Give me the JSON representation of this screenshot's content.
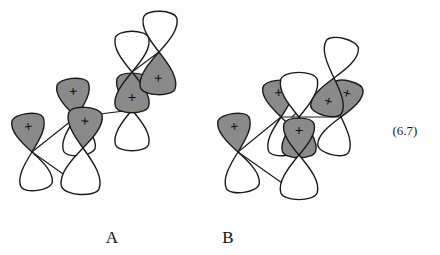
{
  "figure": {
    "kind": "orbital-interaction-diagram",
    "equation_number": "(6.7)",
    "background_color": "#fdfdfd",
    "stroke_color": "#1a1a1a",
    "shaded_lobe_color": "#8a8a8a",
    "empty_lobe_color": "#ffffff",
    "phase_symbol": "+",
    "structures": [
      {
        "label": "A",
        "label_x": 112,
        "label_y": 243,
        "description": "Five p-orbital units connected by bond lines in a zig-zag chain ascending left to right",
        "orbitals": [
          {
            "name": "orbital-a1",
            "cx": 32,
            "cy": 152,
            "rot": -8,
            "top": "shaded",
            "bottom": "empty",
            "plus": true,
            "top_len": 40,
            "bot_len": 40
          },
          {
            "name": "orbital-a2",
            "cx": 76,
            "cy": 117,
            "rot": -6,
            "top": "shaded",
            "bottom": "empty",
            "plus": true,
            "top_len": 40,
            "bot_len": 40
          },
          {
            "name": "orbital-a3",
            "cx": 83,
            "cy": 148,
            "rot": 4,
            "top": "shaded",
            "bottom": "empty",
            "plus": true,
            "top_len": 42,
            "bot_len": 48,
            "lower": true
          },
          {
            "name": "orbital-a4",
            "cx": 132,
            "cy": 110,
            "rot": 0,
            "top": "shaded",
            "bottom": "empty",
            "plus": true,
            "top_len": 38,
            "bot_len": 42
          },
          {
            "name": "orbital-a5",
            "cx": 132,
            "cy": 72,
            "rot": 0,
            "top": "empty",
            "bottom": "shaded",
            "plus": true,
            "top_len": 42,
            "bot_len": 42
          },
          {
            "name": "orbital-a6",
            "cx": 159,
            "cy": 52,
            "rot": 2,
            "top": "empty",
            "bottom": "shaded",
            "plus": true,
            "top_len": 42,
            "bot_len": 44
          }
        ],
        "bonds": [
          {
            "name": "bond-a-1",
            "x1": 32,
            "y1": 152,
            "x2": 76,
            "y2": 117
          },
          {
            "name": "bond-a-2",
            "x1": 32,
            "y1": 152,
            "x2": 83,
            "y2": 188
          },
          {
            "name": "bond-a-3",
            "x1": 76,
            "y1": 117,
            "x2": 132,
            "y2": 110
          },
          {
            "name": "bond-a-4",
            "x1": 132,
            "y1": 72,
            "x2": 159,
            "y2": 52
          }
        ]
      },
      {
        "label": "B",
        "label_x": 228,
        "label_y": 243,
        "description": "Five p-orbital units; central column stacked vertically, upper-right pair tilted",
        "orbitals": [
          {
            "name": "orbital-b1",
            "cx": 238,
            "cy": 152,
            "rot": -8,
            "top": "shaded",
            "bottom": "empty",
            "plus": true,
            "top_len": 40,
            "bot_len": 42
          },
          {
            "name": "orbital-b2",
            "cx": 281,
            "cy": 117,
            "rot": -6,
            "top": "shaded",
            "bottom": "empty",
            "plus": true,
            "top_len": 38,
            "bot_len": 40
          },
          {
            "name": "orbital-b3",
            "cx": 299,
            "cy": 117,
            "rot": 0,
            "top": "empty",
            "bottom": "shaded",
            "plus": true,
            "top_len": 46,
            "bot_len": 42
          },
          {
            "name": "orbital-b4",
            "cx": 299,
            "cy": 155,
            "rot": 0,
            "top": "shaded",
            "bottom": "empty",
            "plus": true,
            "top_len": 38,
            "bot_len": 46
          },
          {
            "name": "orbital-b5",
            "cx": 341,
            "cy": 117,
            "rot": 14,
            "top": "shaded",
            "bottom": "empty",
            "plus": true,
            "top_len": 38,
            "bot_len": 40
          },
          {
            "name": "orbital-b6",
            "cx": 334,
            "cy": 78,
            "rot": 14,
            "top": "empty",
            "bottom": "shaded",
            "plus": true,
            "top_len": 42,
            "bot_len": 40
          }
        ],
        "bonds": [
          {
            "name": "bond-b-1",
            "x1": 238,
            "y1": 152,
            "x2": 281,
            "y2": 117
          },
          {
            "name": "bond-b-2",
            "x1": 238,
            "y1": 152,
            "x2": 292,
            "y2": 190
          },
          {
            "name": "bond-b-3",
            "x1": 281,
            "y1": 117,
            "x2": 341,
            "y2": 117
          },
          {
            "name": "bond-b-4",
            "x1": 292,
            "y1": 117,
            "x2": 334,
            "y2": 78
          }
        ]
      }
    ]
  }
}
